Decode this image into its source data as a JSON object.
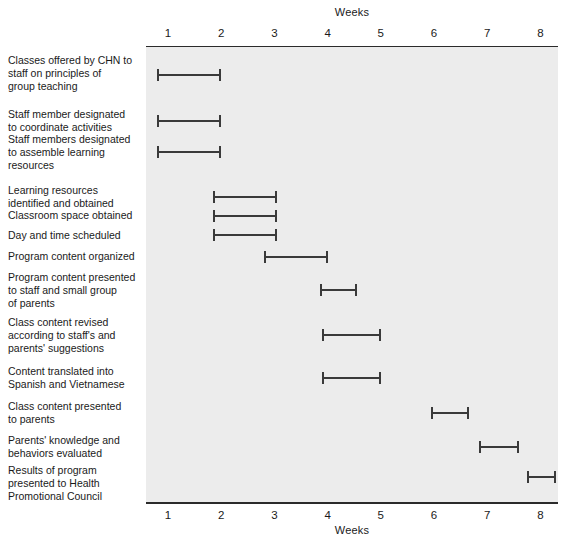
{
  "chart_data": {
    "type": "bar",
    "title": "Weeks",
    "subtitle": "",
    "xlabel": "Weeks",
    "ylabel": "",
    "xlim": [
      0.8,
      8.4
    ],
    "grid": false,
    "legend": "none",
    "x_ticks_top": [
      "1",
      "2",
      "3",
      "4",
      "5",
      "6",
      "7",
      "8"
    ],
    "x_ticks_bottom": [
      "1",
      "2",
      "3",
      "4",
      "5",
      "6",
      "7",
      "8"
    ],
    "categories": [
      "Classes offered by CHN to staff on principles of group teaching",
      "Staff member designated to coordinate activities",
      "Staff members designated to assemble learning resources",
      "Learning resources identified and obtained",
      "Classroom space obtained",
      "Day and time scheduled",
      "Program content organized",
      "Program content presented to staff and small group of parents",
      "Class content revised according to staff's and parents' suggestions",
      "Content translated into Spanish and Vietnamese",
      "Class content presented to parents",
      "Parents' knowledge and behaviors evaluated",
      "Results of program presented to Health Promotional Council"
    ],
    "tasks": [
      {
        "label_lines": [
          "Classes offered by CHN to",
          "staff on principles of",
          "group teaching"
        ],
        "start_week": 0.8,
        "end_week": 2.0,
        "bar_top": 69,
        "label_top": 54
      },
      {
        "label_lines": [
          "Staff member designated",
          "to coordinate activities"
        ],
        "start_week": 0.8,
        "end_week": 2.0,
        "bar_top": 115,
        "label_top": 108
      },
      {
        "label_lines": [
          "Staff members designated",
          "to assemble learning",
          "resources"
        ],
        "start_week": 0.8,
        "end_week": 2.0,
        "bar_top": 146,
        "label_top": 133
      },
      {
        "label_lines": [
          "Learning resources",
          "identified and obtained"
        ],
        "start_week": 1.85,
        "end_week": 3.05,
        "bar_top": 191,
        "label_top": 184
      },
      {
        "label_lines": [
          "Classroom space obtained"
        ],
        "start_week": 1.85,
        "end_week": 3.05,
        "bar_top": 210,
        "label_top": 209
      },
      {
        "label_lines": [
          "Day and time scheduled"
        ],
        "start_week": 1.85,
        "end_week": 3.05,
        "bar_top": 229,
        "label_top": 229
      },
      {
        "label_lines": [
          "Program content organized"
        ],
        "start_week": 2.8,
        "end_week": 4.0,
        "bar_top": 251,
        "label_top": 250
      },
      {
        "label_lines": [
          "Program content presented",
          "to staff and small group",
          "of parents"
        ],
        "start_week": 3.85,
        "end_week": 4.55,
        "bar_top": 284,
        "label_top": 271
      },
      {
        "label_lines": [
          "Class content revised",
          "according to staff's and",
          "parents' suggestions"
        ],
        "start_week": 3.9,
        "end_week": 5.0,
        "bar_top": 329,
        "label_top": 316
      },
      {
        "label_lines": [
          "Content translated into",
          "Spanish and Vietnamese"
        ],
        "start_week": 3.9,
        "end_week": 5.0,
        "bar_top": 372,
        "label_top": 365
      },
      {
        "label_lines": [
          "Class content presented",
          "to parents"
        ],
        "start_week": 5.95,
        "end_week": 6.65,
        "bar_top": 407,
        "label_top": 400
      },
      {
        "label_lines": [
          "Parents' knowledge and",
          "behaviors evaluated"
        ],
        "start_week": 6.85,
        "end_week": 7.6,
        "bar_top": 441,
        "label_top": 434
      },
      {
        "label_lines": [
          "Results of program",
          "presented to Health",
          "Promotional Council"
        ],
        "start_week": 7.75,
        "end_week": 8.3,
        "bar_top": 471,
        "label_top": 464
      }
    ]
  },
  "axis_geometry": {
    "week1_x": 168,
    "week_spacing": 53.2
  },
  "colors": {
    "plot_background": "#ececec",
    "page_background": "#ffffff",
    "axis": "#2b2b2b",
    "bar": "#3a3a3a",
    "text": "#1a1a1a"
  }
}
